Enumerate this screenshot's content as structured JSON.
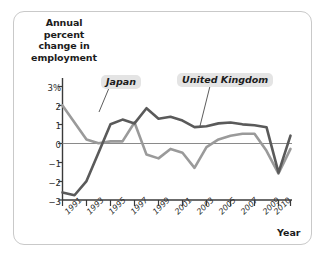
{
  "figure": {
    "border_color": "#c9c9c9",
    "background": "#ffffff"
  },
  "axes": {
    "y_title": "Annual percent change in employment",
    "x_title": "Year",
    "y_ticks": [
      "3%",
      "2",
      "1",
      "0",
      "−1",
      "−2",
      "−3"
    ],
    "x_ticks": [
      "1991",
      "1993",
      "1995",
      "1997",
      "1999",
      "2001",
      "2003",
      "2005",
      "2007",
      "2009",
      "2010"
    ]
  },
  "callouts": {
    "japan": "Japan",
    "united_kingdom": "United Kingdom"
  },
  "colors": {
    "japan_line": "#9a9a9a",
    "uk_line": "#5a5a5a",
    "zero_line": "#808080",
    "axis": "#3a3a3a"
  },
  "chart_data": {
    "type": "line",
    "title": "",
    "xlabel": "Year",
    "ylabel": "Annual percent change in employment",
    "xlim": [
      1991,
      2010
    ],
    "ylim": [
      -3,
      3
    ],
    "grid": false,
    "legend": "callout-labels",
    "x": [
      1991,
      1992,
      1993,
      1994,
      1995,
      1996,
      1997,
      1998,
      1999,
      2000,
      2001,
      2002,
      2003,
      2004,
      2005,
      2006,
      2007,
      2008,
      2009,
      2010
    ],
    "series": [
      {
        "name": "Japan",
        "color": "#9a9a9a",
        "values": [
          2.0,
          1.1,
          0.2,
          0.0,
          0.1,
          0.1,
          1.1,
          -0.6,
          -0.8,
          -0.3,
          -0.5,
          -1.3,
          -0.2,
          0.2,
          0.4,
          0.5,
          0.5,
          -0.4,
          -1.6,
          -0.3
        ]
      },
      {
        "name": "United Kingdom",
        "color": "#5a5a5a",
        "values": [
          -2.6,
          -2.75,
          -2.0,
          -0.5,
          1.0,
          1.25,
          1.05,
          1.85,
          1.3,
          1.4,
          1.2,
          0.85,
          0.9,
          1.05,
          1.1,
          1.0,
          0.95,
          0.85,
          -1.55,
          0.4
        ]
      }
    ],
    "zero_reference_line": 0
  }
}
